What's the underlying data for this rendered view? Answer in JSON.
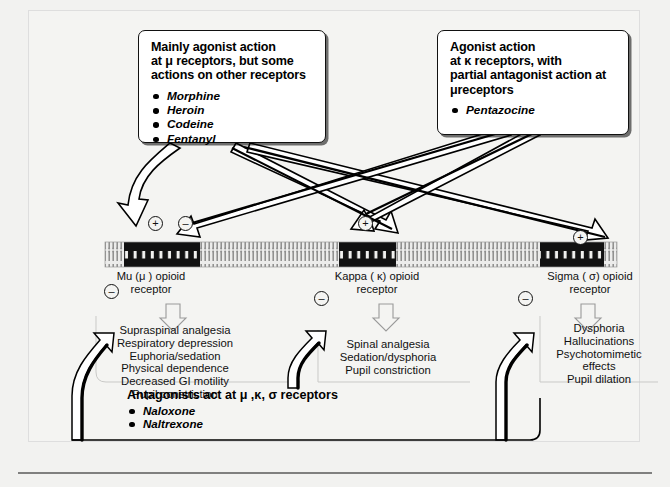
{
  "callouts": {
    "agonist": {
      "name": "mainly-agonist-callout",
      "heading": "Mainly agonist action at μ receptors, but some actions on other receptors",
      "heading_lines": [
        "Mainly agonist action",
        "at μ receptors, but some",
        "actions on other receptors"
      ],
      "drugs": [
        "Morphine",
        "Heroin",
        "Codeine",
        "Fentanyl"
      ]
    },
    "partial_agonist": {
      "name": "partial-agonist-callout",
      "heading": "Agonist action at κ receptors, with partial antagonist action at μ receptors",
      "heading_lines": [
        "Agonist action",
        "at κ receptors, with",
        "partial antagonist action at",
        "μreceptors"
      ],
      "drugs": [
        "Pentazocine"
      ]
    },
    "antagonist": {
      "name": "antagonist-callout",
      "heading": "Antagonists act at μ ,κ, σ receptors",
      "drugs": [
        "Naloxone",
        "Naltrexone"
      ]
    }
  },
  "receptors": [
    {
      "id": "mu",
      "label_lines": [
        "Mu (μ ) opioid",
        "receptor"
      ],
      "top_signs": [
        "+",
        "–"
      ],
      "bottom_sign": "–",
      "effects": [
        "Supraspinal analgesia",
        "Respiratory depression",
        "Euphoria/sedation",
        "Physical dependence",
        "Decreased GI motility",
        "Pupil constriction"
      ]
    },
    {
      "id": "kappa",
      "label_lines": [
        "Kappa ( κ) opioid",
        "receptor"
      ],
      "top_signs": [
        "+"
      ],
      "bottom_sign": "–",
      "effects": [
        "Spinal analgesia",
        "Sedation/dysphoria",
        "Pupil constriction"
      ]
    },
    {
      "id": "sigma",
      "label_lines": [
        "Sigma ( σ) opioid",
        "receptor"
      ],
      "top_signs": [
        "+"
      ],
      "bottom_sign": "–",
      "effects": [
        "Dysphoria",
        "Hallucinations",
        "Psychotomimetic",
        "effects",
        "Pupil dilation"
      ]
    }
  ],
  "colors": {
    "page_background": "#f2f2f0",
    "panel_background": "#f4f4f2",
    "ink": "#111111",
    "callout_fill": "#ffffff",
    "membrane_dark": "#111111",
    "membrane_light": "#e8e8e6"
  }
}
